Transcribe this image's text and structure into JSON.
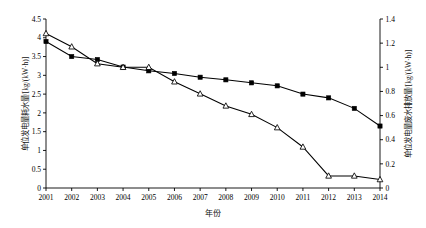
{
  "chart_data": {
    "type": "line",
    "title": "",
    "xlabel": "年份",
    "categories": [
      "2001",
      "2002",
      "2003",
      "2004",
      "2005",
      "2006",
      "2007",
      "2008",
      "2009",
      "2010",
      "2011",
      "2012",
      "2013",
      "2014"
    ],
    "grid": false,
    "legend_position": "none",
    "axes": {
      "left": {
        "label": "单位发电量耗水量/[kg/(kW·h)]",
        "ylim": [
          0,
          4.5
        ],
        "ticks": [
          "0",
          "0.5",
          "1",
          "1.5",
          "2",
          "2.5",
          "3",
          "3.5",
          "4",
          "4.5"
        ],
        "tick_values": [
          0,
          0.5,
          1,
          1.5,
          2,
          2.5,
          3,
          3.5,
          4,
          4.5
        ]
      },
      "right": {
        "label": "单位发电量废水排放量/[kg/(kW·h)]",
        "ylim": [
          0,
          1.4
        ],
        "ticks": [
          "0",
          "0.2",
          "0.4",
          "0.6",
          "0.8",
          "1",
          "1.2",
          "1.4"
        ],
        "tick_values": [
          0,
          0.2,
          0.4,
          0.6,
          0.8,
          1.0,
          1.2,
          1.4
        ]
      }
    },
    "series": [
      {
        "name": "单位发电量耗水量",
        "axis": "left",
        "marker": "filled-square",
        "color": "#000000",
        "values": [
          3.9,
          3.5,
          3.42,
          3.22,
          3.12,
          3.05,
          2.95,
          2.88,
          2.8,
          2.72,
          2.5,
          2.4,
          2.12,
          1.65
        ]
      },
      {
        "name": "单位发电量废水排放量",
        "axis": "right",
        "marker": "open-triangle",
        "color": "#000000",
        "values": [
          1.28,
          1.17,
          1.03,
          1.0,
          1.0,
          0.88,
          0.78,
          0.68,
          0.61,
          0.5,
          0.34,
          0.1,
          0.1,
          0.07
        ]
      }
    ]
  }
}
